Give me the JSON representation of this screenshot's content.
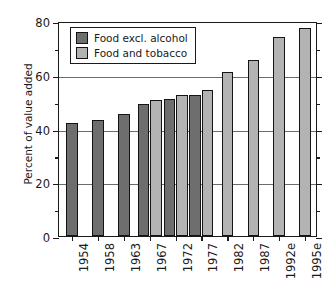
{
  "chart_data": {
    "type": "bar",
    "title": "",
    "xlabel": "",
    "ylabel": "Percent of value added",
    "ylim": [
      0,
      80
    ],
    "ytick_major": [
      0,
      20,
      40,
      60,
      80
    ],
    "ytick_minor": [
      10,
      30,
      50,
      70
    ],
    "ytick_labels": [
      "0",
      "20",
      "40",
      "60",
      "80"
    ],
    "grid": "horizontal-major",
    "legend_position": "upper-left-inside",
    "orientation": "vertical",
    "categories": [
      "1954",
      "1958",
      "1963",
      "1967",
      "1972",
      "1977",
      "1982",
      "1987",
      "1992e",
      "1995e"
    ],
    "series": [
      {
        "name": "Food excl. alcohol",
        "color": "#6e6e6e",
        "values": [
          42.0,
          43.0,
          45.5,
          49.0,
          51.0,
          52.5,
          null,
          null,
          null,
          null
        ]
      },
      {
        "name": "Food and tobacco",
        "color": "#b3b3b3",
        "values": [
          null,
          null,
          null,
          50.5,
          52.5,
          54.5,
          61.0,
          65.5,
          74.0,
          77.5
        ]
      }
    ]
  },
  "legend": {
    "entries": [
      {
        "label": "Food excl. alcohol",
        "color": "#6e6e6e"
      },
      {
        "label": "Food and tobacco",
        "color": "#b3b3b3"
      }
    ]
  },
  "axes": {
    "y_title": "Percent of value added"
  },
  "colors": {
    "series_dark": "#6e6e6e",
    "series_light": "#b3b3b3",
    "axis": "#1a1a1a",
    "gridline": "#6b6b6b",
    "background": "#ffffff"
  }
}
